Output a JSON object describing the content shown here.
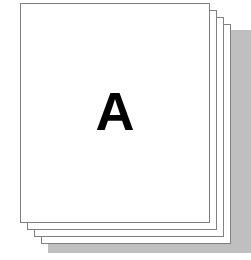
{
  "icon": {
    "name": "paper-stack-icon",
    "description": "Stack of blank white sheets of paper with the letter A on the front sheet",
    "sheet_count": 4,
    "colors": {
      "page_fill": "#ffffff",
      "page_border": "#808080",
      "shadow": "#bfbfbf",
      "letter": "#000000",
      "background": "#ffffff"
    },
    "shadow": {
      "name": "drop-shadow"
    },
    "sheets": [
      {
        "name": "sheet-back-4",
        "label": ""
      },
      {
        "name": "sheet-back-3",
        "label": ""
      },
      {
        "name": "sheet-back-2",
        "label": ""
      },
      {
        "name": "sheet-front-1",
        "label": "A"
      }
    ],
    "front_page": {
      "letter": "A"
    }
  }
}
